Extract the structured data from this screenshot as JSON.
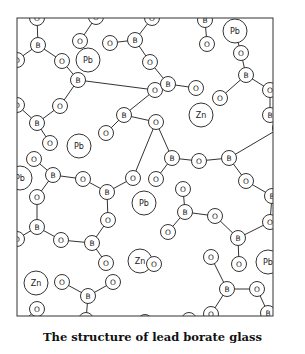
{
  "caption": "The structure of lead borate glass",
  "frame": {
    "x": 17,
    "y": 18,
    "w": 256,
    "h": 298
  },
  "colors": {
    "stroke": "#333333",
    "text": "#222222",
    "background": "#ffffff"
  },
  "atoms": [
    {
      "id": "o1",
      "el": "O",
      "x": 37,
      "y": 18
    },
    {
      "id": "b1",
      "el": "B",
      "x": 38,
      "y": 45
    },
    {
      "id": "o2",
      "el": "O",
      "x": 17,
      "y": 60
    },
    {
      "id": "o3",
      "el": "O",
      "x": 62,
      "y": 61
    },
    {
      "id": "o4",
      "el": "O",
      "x": 80,
      "y": 41
    },
    {
      "id": "pb1",
      "el": "Pb",
      "x": 88,
      "y": 60,
      "big": true
    },
    {
      "id": "o5",
      "el": "O",
      "x": 96,
      "y": 17
    },
    {
      "id": "o6",
      "el": "O",
      "x": 110,
      "y": 43
    },
    {
      "id": "b2",
      "el": "B",
      "x": 135,
      "y": 40
    },
    {
      "id": "o7",
      "el": "O",
      "x": 152,
      "y": 18
    },
    {
      "id": "o8",
      "el": "O",
      "x": 150,
      "y": 62
    },
    {
      "id": "b3",
      "el": "B",
      "x": 205,
      "y": 20
    },
    {
      "id": "o9",
      "el": "O",
      "x": 207,
      "y": 44
    },
    {
      "id": "pb2",
      "el": "Pb",
      "x": 235,
      "y": 31,
      "big": true
    },
    {
      "id": "o10",
      "el": "O",
      "x": 241,
      "y": 53
    },
    {
      "id": "b4",
      "el": "B",
      "x": 246,
      "y": 75
    },
    {
      "id": "o11",
      "el": "O",
      "x": 270,
      "y": 90
    },
    {
      "id": "o12",
      "el": "O",
      "x": 220,
      "y": 98
    },
    {
      "id": "b5",
      "el": "B",
      "x": 270,
      "y": 115
    },
    {
      "id": "o13",
      "el": "O",
      "x": 280,
      "y": 128
    },
    {
      "id": "o14",
      "el": "O",
      "x": 155,
      "y": 90
    },
    {
      "id": "b6",
      "el": "B",
      "x": 168,
      "y": 84
    },
    {
      "id": "o15",
      "el": "O",
      "x": 196,
      "y": 88
    },
    {
      "id": "zn1",
      "el": "Zn",
      "x": 201,
      "y": 115,
      "big": true
    },
    {
      "id": "b7",
      "el": "B",
      "x": 78,
      "y": 80
    },
    {
      "id": "o16",
      "el": "O",
      "x": 60,
      "y": 106
    },
    {
      "id": "o17",
      "el": "O",
      "x": 17,
      "y": 105
    },
    {
      "id": "b8",
      "el": "B",
      "x": 37,
      "y": 123
    },
    {
      "id": "o18",
      "el": "O",
      "x": 50,
      "y": 143
    },
    {
      "id": "b9",
      "el": "B",
      "x": 124,
      "y": 115
    },
    {
      "id": "o19",
      "el": "O",
      "x": 106,
      "y": 133
    },
    {
      "id": "o20",
      "el": "O",
      "x": 156,
      "y": 122
    },
    {
      "id": "pb3",
      "el": "Pb",
      "x": 79,
      "y": 146,
      "big": true
    },
    {
      "id": "o21",
      "el": "O",
      "x": 34,
      "y": 159
    },
    {
      "id": "b10",
      "el": "B",
      "x": 53,
      "y": 175
    },
    {
      "id": "pb4",
      "el": "Pb",
      "x": 20,
      "y": 178,
      "big": true
    },
    {
      "id": "o22",
      "el": "O",
      "x": 83,
      "y": 179
    },
    {
      "id": "b11",
      "el": "B",
      "x": 107,
      "y": 192
    },
    {
      "id": "o23",
      "el": "O",
      "x": 133,
      "y": 178
    },
    {
      "id": "o24",
      "el": "O",
      "x": 37,
      "y": 197
    },
    {
      "id": "o25",
      "el": "O",
      "x": 108,
      "y": 220
    },
    {
      "id": "b12",
      "el": "B",
      "x": 172,
      "y": 158
    },
    {
      "id": "o26",
      "el": "O",
      "x": 199,
      "y": 161
    },
    {
      "id": "b13",
      "el": "B",
      "x": 229,
      "y": 158
    },
    {
      "id": "o27",
      "el": "O",
      "x": 156,
      "y": 179
    },
    {
      "id": "o28",
      "el": "O",
      "x": 246,
      "y": 181
    },
    {
      "id": "b14",
      "el": "B",
      "x": 272,
      "y": 196
    },
    {
      "id": "o29",
      "el": "O",
      "x": 270,
      "y": 222
    },
    {
      "id": "pb5",
      "el": "Pb",
      "x": 144,
      "y": 203,
      "big": true
    },
    {
      "id": "o30",
      "el": "O",
      "x": 183,
      "y": 189
    },
    {
      "id": "b15",
      "el": "B",
      "x": 185,
      "y": 212
    },
    {
      "id": "o31",
      "el": "O",
      "x": 215,
      "y": 216
    },
    {
      "id": "o32",
      "el": "O",
      "x": 168,
      "y": 232
    },
    {
      "id": "b16",
      "el": "B",
      "x": 37,
      "y": 227
    },
    {
      "id": "o33",
      "el": "O",
      "x": 61,
      "y": 240
    },
    {
      "id": "b17",
      "el": "B",
      "x": 92,
      "y": 243
    },
    {
      "id": "o34",
      "el": "O",
      "x": 106,
      "y": 263
    },
    {
      "id": "zn2",
      "el": "Zn",
      "x": 140,
      "y": 261,
      "big": true
    },
    {
      "id": "o35",
      "el": "O",
      "x": 17,
      "y": 239
    },
    {
      "id": "o36",
      "el": "O",
      "x": 154,
      "y": 264
    },
    {
      "id": "o37",
      "el": "O",
      "x": 211,
      "y": 257
    },
    {
      "id": "b18",
      "el": "B",
      "x": 238,
      "y": 238
    },
    {
      "id": "o38",
      "el": "O",
      "x": 239,
      "y": 264
    },
    {
      "id": "pb6",
      "el": "Pb",
      "x": 268,
      "y": 262,
      "big": true
    },
    {
      "id": "zn3",
      "el": "Zn",
      "x": 36,
      "y": 283,
      "big": true
    },
    {
      "id": "o39",
      "el": "O",
      "x": 62,
      "y": 282
    },
    {
      "id": "b19",
      "el": "B",
      "x": 88,
      "y": 296
    },
    {
      "id": "o40",
      "el": "O",
      "x": 113,
      "y": 282
    },
    {
      "id": "o41",
      "el": "O",
      "x": 37,
      "y": 309
    },
    {
      "id": "o42",
      "el": "O",
      "x": 86,
      "y": 320
    },
    {
      "id": "o43",
      "el": "O",
      "x": 17,
      "y": 327
    },
    {
      "id": "b20",
      "el": "B",
      "x": 227,
      "y": 289
    },
    {
      "id": "o44",
      "el": "O",
      "x": 257,
      "y": 289
    },
    {
      "id": "o45",
      "el": "O",
      "x": 281,
      "y": 285
    },
    {
      "id": "o46",
      "el": "O",
      "x": 211,
      "y": 314
    },
    {
      "id": "b21",
      "el": "B",
      "x": 268,
      "y": 313
    },
    {
      "id": "zn4",
      "el": "Zn",
      "x": 210,
      "y": 330,
      "big": true
    },
    {
      "id": "b22",
      "el": "B",
      "x": 113,
      "y": 330
    },
    {
      "id": "o47",
      "el": "O",
      "x": 145,
      "y": 322
    },
    {
      "id": "o48",
      "el": "O",
      "x": 189,
      "y": 320
    },
    {
      "id": "o49",
      "el": "O",
      "x": 258,
      "y": 332
    }
  ],
  "bonds": [
    [
      "o1",
      "b1"
    ],
    [
      "b1",
      "o2"
    ],
    [
      "b1",
      "o3"
    ],
    [
      "o3",
      "b7"
    ],
    [
      "o4",
      "o5"
    ],
    [
      "o6",
      "b2"
    ],
    [
      "b2",
      "o7"
    ],
    [
      "b2",
      "o8"
    ],
    [
      "o8",
      "b6"
    ],
    [
      "b3",
      "o9"
    ],
    [
      "pb2",
      "o10"
    ],
    [
      "o10",
      "b4"
    ],
    [
      "b4",
      "o11"
    ],
    [
      "b4",
      "o12"
    ],
    [
      "o11",
      "b5"
    ],
    [
      "b5",
      "o13"
    ],
    [
      "b6",
      "o14"
    ],
    [
      "b6",
      "o15"
    ],
    [
      "b7",
      "o16"
    ],
    [
      "o16",
      "b8"
    ],
    [
      "b8",
      "o17"
    ],
    [
      "b8",
      "o18"
    ],
    [
      "b7",
      "o14"
    ],
    [
      "o14",
      "b9"
    ],
    [
      "b9",
      "o19"
    ],
    [
      "b9",
      "o20"
    ],
    [
      "o21",
      "b10"
    ],
    [
      "b10",
      "o22"
    ],
    [
      "b10",
      "o24"
    ],
    [
      "o22",
      "b11"
    ],
    [
      "b11",
      "o23"
    ],
    [
      "b11",
      "o25"
    ],
    [
      "o23",
      "o20"
    ],
    [
      "o20",
      "b12"
    ],
    [
      "b12",
      "o26"
    ],
    [
      "o26",
      "b13"
    ],
    [
      "b13",
      "o13"
    ],
    [
      "b13",
      "o28"
    ],
    [
      "o28",
      "b14"
    ],
    [
      "b14",
      "o29"
    ],
    [
      "b12",
      "o27"
    ],
    [
      "o30",
      "b15"
    ],
    [
      "b15",
      "o31"
    ],
    [
      "b15",
      "o32"
    ],
    [
      "o31",
      "b18"
    ],
    [
      "b18",
      "o29"
    ],
    [
      "b18",
      "o38"
    ],
    [
      "o24",
      "b16"
    ],
    [
      "b16",
      "o35"
    ],
    [
      "b16",
      "o33"
    ],
    [
      "o33",
      "b17"
    ],
    [
      "b17",
      "o25"
    ],
    [
      "b17",
      "o34"
    ],
    [
      "o37",
      "b20"
    ],
    [
      "b20",
      "o44"
    ],
    [
      "b20",
      "o46"
    ],
    [
      "o44",
      "b21"
    ],
    [
      "b21",
      "o49"
    ],
    [
      "o39",
      "b19"
    ],
    [
      "b19",
      "o40"
    ],
    [
      "b19",
      "o42"
    ],
    [
      "o42",
      "b22"
    ],
    [
      "b22",
      "o47"
    ],
    [
      "o41",
      "o43"
    ],
    [
      "o47",
      "b22"
    ]
  ]
}
